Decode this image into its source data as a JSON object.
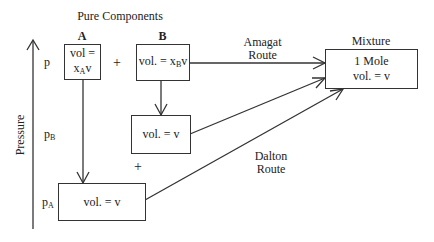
{
  "title": "Pure Components",
  "axis": {
    "label": "Pressure",
    "levels": {
      "p": "p",
      "pB_main": "p",
      "pB_sub": "B",
      "pA_main": "p",
      "pA_sub": "A"
    }
  },
  "components": {
    "A": {
      "header": "A",
      "line1": "vol =",
      "line2_main": "x",
      "line2_sub": "A",
      "line2_tail": "v"
    },
    "plus_top": "+",
    "B": {
      "header": "B",
      "main": "vol. = x",
      "sub": "B",
      "tail": "v"
    }
  },
  "intermediate": {
    "B_at_pB": "vol. = v",
    "plus_bottom": "+",
    "A_at_pA": "vol. = v"
  },
  "mixture": {
    "header": "Mixture",
    "line1": "1 Mole",
    "line2": "vol. = v"
  },
  "routes": {
    "amagat": {
      "line1": "Amagat",
      "line2": "Route"
    },
    "dalton": {
      "line1": "Dalton",
      "line2": "Route"
    }
  },
  "colors": {
    "line": "#333333",
    "text": "#222222",
    "background": "#ffffff"
  }
}
